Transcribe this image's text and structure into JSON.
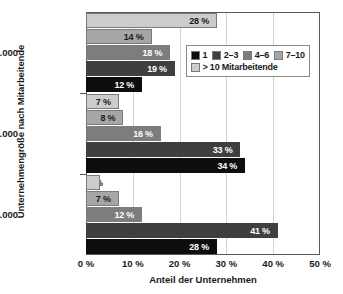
{
  "chart_data": {
    "type": "bar",
    "orientation": "horizontal",
    "title": "",
    "xlabel": "Anteil der Unternehmen",
    "ylabel": "Unternehmengröße nach Mitarbeitende",
    "categories": [
      ">5.000",
      "1.001–5.000",
      "500–1.000"
    ],
    "xlim": [
      0,
      50
    ],
    "xticks": [
      0,
      10,
      20,
      30,
      40,
      50
    ],
    "xtick_labels": [
      "0 %",
      "10 %",
      "20 %",
      "30 %",
      "40 %",
      "50 %"
    ],
    "grid": "vertical",
    "legend_position": "upper-right-inside",
    "series": [
      {
        "name": "1",
        "color": "#0d0d0d",
        "values": [
          12,
          34,
          28
        ],
        "value_labels": [
          "12 %",
          "34 %",
          "28 %"
        ]
      },
      {
        "name": "2–3",
        "color": "#3f3f3f",
        "values": [
          19,
          33,
          41
        ],
        "value_labels": [
          "19 %",
          "33 %",
          "41 %"
        ]
      },
      {
        "name": "4–6",
        "color": "#7d7d7d",
        "values": [
          18,
          16,
          12
        ],
        "value_labels": [
          "18 %",
          "16 %",
          "12 %"
        ]
      },
      {
        "name": "7–10",
        "color": "#a6a6a6",
        "values": [
          14,
          8,
          7
        ],
        "value_labels": [
          "14 %",
          "8 %",
          "7 %"
        ]
      },
      {
        "name": "> 10 Mitarbeitende",
        "color": "#cccccc",
        "values": [
          28,
          7,
          3
        ],
        "value_labels": [
          "28 %",
          "7 %",
          "3 %"
        ]
      }
    ]
  }
}
